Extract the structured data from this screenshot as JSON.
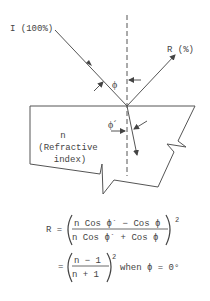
{
  "diagram": {
    "incident_label": "I (100%)",
    "reflected_label": "R (%)",
    "angle_incident_label": "ϕ",
    "angle_refracted_label": "ϕ´",
    "medium_label_line1": "n",
    "medium_label_line2": "(Refractive",
    "medium_label_line3": "index)",
    "line_color": "#555555",
    "text_color": "#444444"
  },
  "formula": {
    "lhs": "R =",
    "numerator": "n Cos ϕ´ − Cos ϕ",
    "denominator": "n Cos ϕ´ + Cos ϕ",
    "exponent": "2",
    "line2_lhs": "=",
    "line2_numerator": "n − 1",
    "line2_denominator": "n + 1",
    "line2_exponent": "2",
    "line2_condition": "when ϕ = 0°"
  }
}
